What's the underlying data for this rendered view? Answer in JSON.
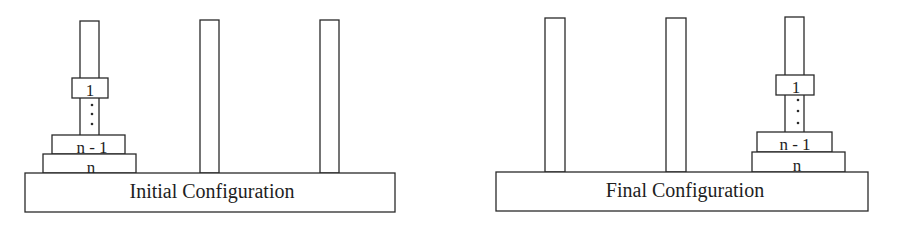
{
  "diagram": {
    "panels": [
      {
        "id": "initial",
        "caption": "Initial Configuration",
        "base": {
          "x": 25,
          "y": 173,
          "w": 370,
          "h": 39
        },
        "pegs": [
          {
            "x": 80,
            "y": 21,
            "w": 19,
            "h": 152
          },
          {
            "x": 200,
            "y": 20,
            "w": 19,
            "h": 153
          },
          {
            "x": 320,
            "y": 20,
            "w": 19,
            "h": 153
          }
        ],
        "disks": [
          {
            "label": "n",
            "x": 43,
            "y": 154,
            "w": 93,
            "h": 19
          },
          {
            "label": "n - 1",
            "x": 52,
            "y": 135,
            "w": 73,
            "h": 19
          },
          {
            "label": "1",
            "x": 72,
            "y": 78,
            "w": 36,
            "h": 20
          }
        ],
        "ellipsis_dots": [
          {
            "x": 92,
            "y": 105
          },
          {
            "x": 92,
            "y": 114
          },
          {
            "x": 92,
            "y": 124
          }
        ],
        "disk_peg_index": 0
      },
      {
        "id": "final",
        "caption": "Final Configuration",
        "base": {
          "x": 496,
          "y": 172,
          "w": 372,
          "h": 39
        },
        "pegs": [
          {
            "x": 545,
            "y": 18,
            "w": 20,
            "h": 154
          },
          {
            "x": 666,
            "y": 18,
            "w": 20,
            "h": 154
          },
          {
            "x": 785,
            "y": 17,
            "w": 19,
            "h": 155
          }
        ],
        "disks": [
          {
            "label": "n",
            "x": 752,
            "y": 152,
            "w": 93,
            "h": 20
          },
          {
            "label": "n - 1",
            "x": 757,
            "y": 132,
            "w": 75,
            "h": 20
          },
          {
            "label": "1",
            "x": 776,
            "y": 75,
            "w": 38,
            "h": 20
          }
        ],
        "ellipsis_dots": [
          {
            "x": 798,
            "y": 100
          },
          {
            "x": 798,
            "y": 111
          },
          {
            "x": 798,
            "y": 123
          }
        ],
        "disk_peg_index": 2
      }
    ]
  }
}
